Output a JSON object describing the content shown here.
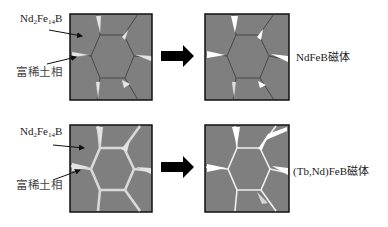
{
  "colors": {
    "grain_fill": "#7f7f7f",
    "grain_border": "#111111",
    "boundary_line": "#3a3a3a",
    "rich_phase": "#e8e8e8",
    "arrow": "#000000",
    "text": "#222222"
  },
  "rows": [
    {
      "id": "top",
      "left_labels": {
        "phase_main": {
          "base": "Nd",
          "sub1": "2",
          "mid": "Fe",
          "sub2": "14",
          "tail": "B"
        },
        "phase_rich": "富稀土相"
      },
      "before_label": "",
      "after_label": "NdFeB磁体",
      "process": "no diffusion — rare-earth-rich phase isolated at triple junctions"
    },
    {
      "id": "bottom",
      "left_labels": {
        "phase_main": {
          "base": "Nd",
          "sub1": "2",
          "mid": "Fe",
          "sub2": "14",
          "tail": "B"
        },
        "phase_rich": "富稀土相"
      },
      "before_label": "",
      "after_label": "(Tb,Nd)FeB磁体",
      "process": "grain boundary diffusion — continuous thin rare-earth-rich layer along boundaries"
    }
  ]
}
